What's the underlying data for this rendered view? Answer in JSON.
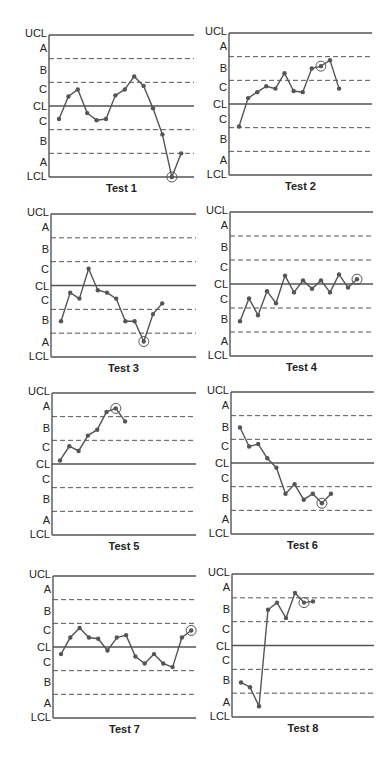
{
  "figure": {
    "zone_labels": [
      "UCL",
      "A",
      "B",
      "C",
      "CL",
      "C",
      "B",
      "A",
      "LCL"
    ],
    "colors": {
      "line": "#555555",
      "point": "#555555",
      "axis": "#555555",
      "dashed": "#555555",
      "text": "#222222"
    }
  },
  "chart_data": [
    {
      "type": "line",
      "title": "Test 1",
      "xlabel": "",
      "ylabel": "",
      "ylim": [
        -3,
        3
      ],
      "y_units": "sigma zones",
      "zone_labels": [
        "UCL",
        "A",
        "B",
        "C",
        "CL",
        "C",
        "B",
        "A",
        "LCL"
      ],
      "solid_lines": {
        "UCL": 3,
        "CL": 0,
        "LCL": -3
      },
      "dashed_lines": [
        2,
        1,
        -1,
        -2
      ],
      "x": [
        1,
        2,
        3,
        4,
        5,
        6,
        7,
        8,
        9,
        10,
        11,
        12,
        13,
        14
      ],
      "values": [
        -0.55,
        0.4,
        0.7,
        -0.3,
        -0.6,
        -0.55,
        0.45,
        0.7,
        1.25,
        0.85,
        -0.1,
        -1.2,
        -3.0,
        -2.0
      ],
      "highlighted_index": 12
    },
    {
      "type": "line",
      "title": "Test 2",
      "xlabel": "",
      "ylabel": "",
      "ylim": [
        -3,
        3
      ],
      "zone_labels": [
        "UCL",
        "A",
        "B",
        "C",
        "CL",
        "C",
        "B",
        "A",
        "LCL"
      ],
      "solid_lines": {
        "UCL": 3,
        "CL": 0,
        "LCL": -3
      },
      "dashed_lines": [
        2,
        1,
        -1,
        -2
      ],
      "x": [
        1,
        2,
        3,
        4,
        5,
        6,
        7,
        8,
        9,
        10,
        11,
        12
      ],
      "values": [
        -0.95,
        0.25,
        0.5,
        0.75,
        0.65,
        1.3,
        0.55,
        0.5,
        1.5,
        1.6,
        1.85,
        0.65
      ],
      "highlighted_index": 9
    },
    {
      "type": "line",
      "title": "Test 3",
      "xlabel": "",
      "ylabel": "",
      "ylim": [
        -3,
        3
      ],
      "zone_labels": [
        "UCL",
        "A",
        "B",
        "C",
        "CL",
        "C",
        "B",
        "A",
        "LCL"
      ],
      "solid_lines": {
        "UCL": 3,
        "CL": 0,
        "LCL": -3
      },
      "dashed_lines": [
        2,
        1,
        -1,
        -2
      ],
      "x": [
        1,
        2,
        3,
        4,
        5,
        6,
        7,
        8,
        9,
        10,
        11,
        12
      ],
      "values": [
        -1.5,
        -0.3,
        -0.55,
        0.7,
        -0.2,
        -0.3,
        -0.55,
        -1.5,
        -1.5,
        -2.35,
        -1.2,
        -0.75
      ],
      "highlighted_index": 9
    },
    {
      "type": "line",
      "title": "Test 4",
      "xlabel": "",
      "ylabel": "",
      "ylim": [
        -3,
        3
      ],
      "zone_labels": [
        "UCL",
        "A",
        "B",
        "C",
        "CL",
        "C",
        "B",
        "A",
        "LCL"
      ],
      "solid_lines": {
        "UCL": 3,
        "CL": 0,
        "LCL": -3
      },
      "dashed_lines": [
        2,
        1,
        -1,
        -2
      ],
      "x": [
        1,
        2,
        3,
        4,
        5,
        6,
        7,
        8,
        9,
        10,
        11,
        12,
        13,
        14
      ],
      "values": [
        -1.55,
        -0.6,
        -1.3,
        -0.3,
        -0.8,
        0.35,
        -0.35,
        0.15,
        -0.2,
        0.15,
        -0.35,
        0.4,
        -0.15,
        0.2
      ],
      "highlighted_index": 13
    },
    {
      "type": "line",
      "title": "Test 5",
      "xlabel": "",
      "ylabel": "",
      "ylim": [
        -3,
        3
      ],
      "zone_labels": [
        "UCL",
        "A",
        "B",
        "C",
        "CL",
        "C",
        "B",
        "A",
        "LCL"
      ],
      "solid_lines": {
        "UCL": 3,
        "CL": 0,
        "LCL": -3
      },
      "dashed_lines": [
        2,
        1,
        -1,
        -2
      ],
      "x": [
        1,
        2,
        3,
        4,
        5,
        6,
        7,
        8
      ],
      "values": [
        0.15,
        0.75,
        0.55,
        1.2,
        1.45,
        2.2,
        2.35,
        1.8
      ],
      "highlighted_index": 6
    },
    {
      "type": "line",
      "title": "Test 6",
      "xlabel": "",
      "ylabel": "",
      "ylim": [
        -3,
        3
      ],
      "zone_labels": [
        "UCL",
        "A",
        "B",
        "C",
        "CL",
        "C",
        "B",
        "A",
        "LCL"
      ],
      "solid_lines": {
        "UCL": 3,
        "CL": 0,
        "LCL": -3
      },
      "dashed_lines": [
        2,
        1,
        -1,
        -2
      ],
      "x": [
        1,
        2,
        3,
        4,
        5,
        6,
        7,
        8,
        9,
        10,
        11
      ],
      "values": [
        1.5,
        0.7,
        0.8,
        0.2,
        -0.2,
        -1.3,
        -0.9,
        -1.55,
        -1.3,
        -1.7,
        -1.3
      ],
      "highlighted_index": 9
    },
    {
      "type": "line",
      "title": "Test 7",
      "xlabel": "",
      "ylabel": "",
      "ylim": [
        -3,
        3
      ],
      "zone_labels": [
        "UCL",
        "A",
        "B",
        "C",
        "CL",
        "C",
        "B",
        "A",
        "LCL"
      ],
      "solid_lines": {
        "UCL": 3,
        "CL": 0,
        "LCL": -3
      },
      "dashed_lines": [
        2,
        1,
        -1,
        -2
      ],
      "x": [
        1,
        2,
        3,
        4,
        5,
        6,
        7,
        8,
        9,
        10,
        11,
        12,
        13,
        14,
        15
      ],
      "values": [
        -0.3,
        0.4,
        0.8,
        0.4,
        0.35,
        -0.15,
        0.4,
        0.5,
        -0.4,
        -0.7,
        -0.3,
        -0.7,
        -0.85,
        0.4,
        0.7
      ],
      "highlighted_index": 14
    },
    {
      "type": "line",
      "title": "Test 8",
      "xlabel": "",
      "ylabel": "",
      "ylim": [
        -3,
        3
      ],
      "zone_labels": [
        "UCL",
        "A",
        "B",
        "C",
        "CL",
        "C",
        "B",
        "A",
        "LCL"
      ],
      "solid_lines": {
        "UCL": 3,
        "CL": 0,
        "LCL": -3
      },
      "dashed_lines": [
        2,
        1,
        -1,
        -2
      ],
      "x": [
        1,
        2,
        3,
        4,
        5,
        6,
        7,
        8,
        9
      ],
      "values": [
        -1.55,
        -1.75,
        -2.55,
        1.5,
        1.8,
        1.15,
        2.2,
        1.8,
        1.85
      ],
      "highlighted_index": 7
    }
  ]
}
